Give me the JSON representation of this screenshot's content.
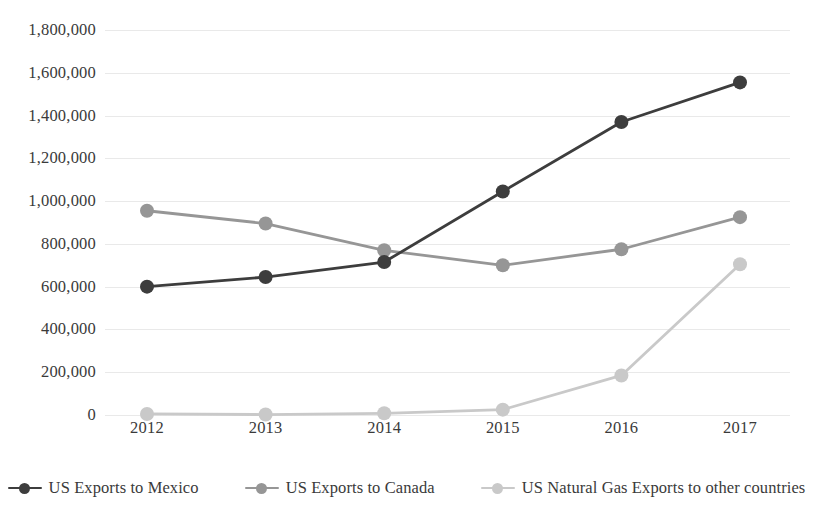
{
  "chart_data": {
    "type": "line",
    "title": "",
    "subtitle": "",
    "xlabel": "",
    "ylabel": "",
    "categories": [
      "2012",
      "2013",
      "2014",
      "2015",
      "2016",
      "2017"
    ],
    "ylim": [
      0,
      1800000
    ],
    "ytick_values": [
      0,
      200000,
      400000,
      600000,
      800000,
      1000000,
      1200000,
      1400000,
      1600000,
      1800000
    ],
    "ytick_labels": [
      "0",
      "200,000",
      "400,000",
      "600,000",
      "800,000",
      "1,000,000",
      "1,200,000",
      "1,400,000",
      "1,600,000",
      "1,800,000"
    ],
    "grid": true,
    "legend_position": "bottom",
    "series": [
      {
        "name": "US Exports to Mexico",
        "color": "#3d3d3d",
        "values": [
          600000,
          645000,
          715000,
          1045000,
          1370000,
          1555000
        ]
      },
      {
        "name": "US Exports to Canada",
        "color": "#969696",
        "values": [
          955000,
          895000,
          770000,
          700000,
          775000,
          925000
        ]
      },
      {
        "name": "US Natural Gas Exports to other countries",
        "color": "#c9c9c9",
        "values": [
          5000,
          2000,
          8000,
          25000,
          185000,
          705000
        ]
      }
    ]
  },
  "colors": {
    "background": "#ffffff",
    "gridline": "#e9e9e9",
    "text": "#3a3a3a",
    "series_mexico": "#3d3d3d",
    "series_canada": "#969696",
    "series_natural_gas": "#c9c9c9"
  },
  "legend": {
    "items": [
      {
        "label": "US Exports to Mexico",
        "color": "#3d3d3d",
        "marker": "line-with-circle-marker"
      },
      {
        "label": "US Exports to Canada",
        "color": "#969696",
        "marker": "line-with-circle-marker"
      },
      {
        "label": "US Natural Gas Exports to other countries",
        "color": "#c9c9c9",
        "marker": "line-with-circle-marker"
      }
    ]
  }
}
